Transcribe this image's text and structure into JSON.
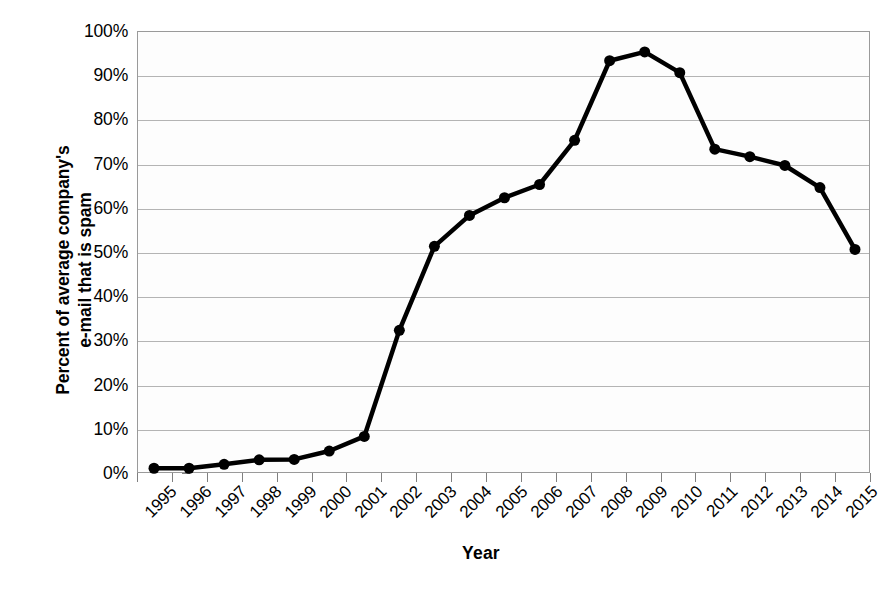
{
  "chart_data": {
    "type": "line",
    "title": "",
    "xlabel": "Year",
    "ylabel": "Percent of average company's e-mail that is spam",
    "ylabel_line1": "Percent of average company's",
    "ylabel_line2": "e-mail that is spam",
    "categories": [
      "1995",
      "1996",
      "1997",
      "1998",
      "1999",
      "2000",
      "2001",
      "2002",
      "2003",
      "2004",
      "2005",
      "2006",
      "2007",
      "2008",
      "2009",
      "2010",
      "2011",
      "2012",
      "2013",
      "2014",
      "2015"
    ],
    "values": [
      1.3,
      1.3,
      2.2,
      3.2,
      3.3,
      5.2,
      8.5,
      32.5,
      51.5,
      58.5,
      62.5,
      65.5,
      75.5,
      93.5,
      95.5,
      90.8,
      73.5,
      71.8,
      69.8,
      64.8,
      50.8
    ],
    "ylim": [
      0,
      100
    ],
    "ytick_values": [
      0,
      10,
      20,
      30,
      40,
      50,
      60,
      70,
      80,
      90,
      100
    ],
    "ytick_labels": [
      "0%",
      "10%",
      "20%",
      "30%",
      "40%",
      "50%",
      "60%",
      "70%",
      "80%",
      "90%",
      "100%"
    ],
    "grid": true,
    "grid_axis": "y",
    "legend": "none",
    "series_color": "#000000",
    "marker": "circle",
    "marker_size": 11,
    "line_width": 4.5,
    "gridline_color": "#b4b4b4",
    "axis_border_color": "#9a9a9a",
    "plot_background": "#fdfdfd",
    "figure_background": "#ffffff"
  }
}
